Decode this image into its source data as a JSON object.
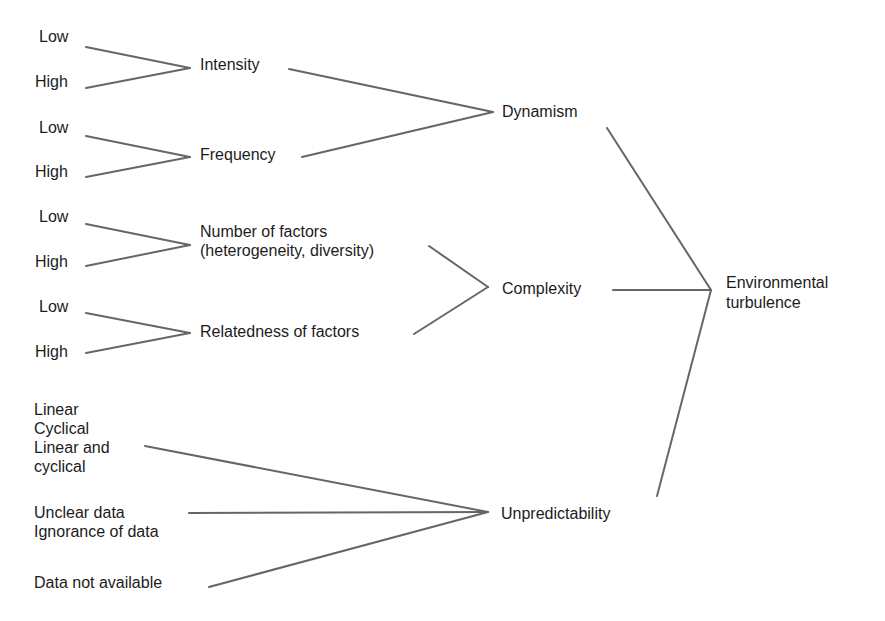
{
  "diagram": {
    "title": "",
    "root": "Environmental turbulence",
    "root_lines": [
      "Environmental",
      "turbulence"
    ],
    "dimensions": {
      "dynamism": {
        "label": "Dynamism",
        "factors": {
          "intensity": {
            "label": "Intensity",
            "levels": [
              "Low",
              "High"
            ]
          },
          "frequency": {
            "label": "Frequency",
            "levels": [
              "Low",
              "High"
            ]
          }
        }
      },
      "complexity": {
        "label": "Complexity",
        "factors": {
          "number": {
            "label": "Number of factors\n(heterogeneity, diversity)",
            "levels": [
              "Low",
              "High"
            ]
          },
          "relatedness": {
            "label": "Relatedness of factors",
            "levels": [
              "Low",
              "High"
            ]
          }
        }
      },
      "unpredictability": {
        "label": "Unpredictability",
        "groups": {
          "pattern": "Linear\nCyclical\nLinear and\ncyclical",
          "data_quality": "Unclear data\nIgnorance of data",
          "availability": "Data not available"
        }
      }
    },
    "colors": {
      "line": "#666666",
      "text": "#1c1c1c",
      "background": "#ffffff"
    }
  }
}
